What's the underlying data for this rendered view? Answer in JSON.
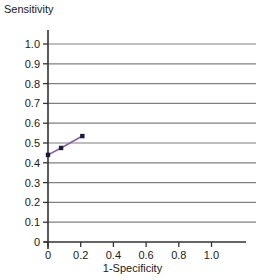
{
  "chart_data": {
    "type": "line",
    "title": "",
    "xlabel": "1-Specificity",
    "ylabel": "Sensitivity",
    "xlim": [
      0,
      1.0
    ],
    "ylim": [
      0,
      1.0
    ],
    "grid": true,
    "grid_axis": "y",
    "legend": "none",
    "x_ticks": [
      "0",
      "0.2",
      "0.4",
      "0.6",
      "0.8",
      "1.0"
    ],
    "x_tick_values": [
      0,
      0.2,
      0.4,
      0.6,
      0.8,
      1.0
    ],
    "y_ticks": [
      "0",
      "0.1",
      "0.2",
      "0.3",
      "0.4",
      "0.5",
      "0.6",
      "0.7",
      "0.8",
      "0.9",
      "1.0"
    ],
    "y_tick_values": [
      0,
      0.1,
      0.2,
      0.3,
      0.4,
      0.5,
      0.6,
      0.7,
      0.8,
      0.9,
      1.0
    ],
    "series": [
      {
        "name": "ROC curve",
        "line_color": "#8a5fa8",
        "marker_color": "#1b1b3a",
        "marker": "square",
        "x": [
          0.0,
          0.08,
          0.21
        ],
        "y": [
          0.44,
          0.475,
          0.535
        ]
      }
    ],
    "colors": {
      "grid": "#7f7f7f",
      "axis": "#333333",
      "text": "#1a1a1a",
      "line": "#8a5fa8",
      "marker": "#1b1b3a",
      "background": "#ffffff"
    }
  }
}
